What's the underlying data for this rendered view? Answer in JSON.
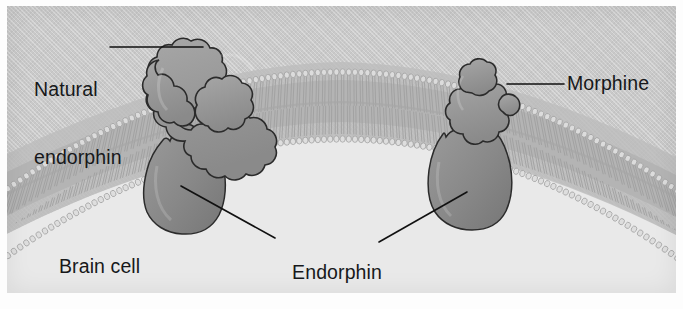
{
  "figure": {
    "kind": "biology-diagram",
    "panel_background": "#c9c9c9",
    "cell_interior_color": "#e9e9e9",
    "receptor_color": "#8d8d8d",
    "ligand_color": "#9a9a9a",
    "outline_color": "#2b2b2b",
    "label_color": "#17181a"
  },
  "labels": {
    "natural_endorphin": {
      "line1": "Natural",
      "line2": "endorphin"
    },
    "morphine": {
      "text": "Morphine"
    },
    "endorphin_receptors": {
      "line1": "Endorphin",
      "line2": "receptors"
    },
    "brain_cell": {
      "text": "Brain cell"
    }
  },
  "structures": {
    "membrane": {
      "name": "phospholipid bilayer",
      "layers": 2
    },
    "receptor_left": {
      "name": "endorphin receptor (left)"
    },
    "receptor_right": {
      "name": "endorphin receptor (right)"
    },
    "endorphin_molecule": {
      "name": "natural endorphin molecule"
    },
    "morphine_molecule": {
      "name": "morphine molecule"
    }
  }
}
